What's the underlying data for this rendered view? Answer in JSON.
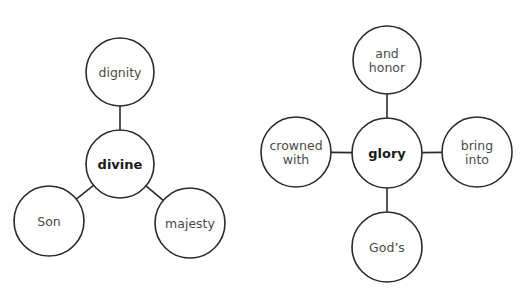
{
  "diagrams": [
    {
      "id": "divine-web",
      "center": {
        "id": "divine",
        "lines": [
          "divine"
        ]
      },
      "satellites": [
        {
          "id": "dignity",
          "lines": [
            "dignity"
          ],
          "position": "top"
        },
        {
          "id": "son",
          "lines": [
            "Son"
          ],
          "position": "bottom-left"
        },
        {
          "id": "majesty",
          "lines": [
            "majesty"
          ],
          "position": "bottom-right"
        }
      ]
    },
    {
      "id": "glory-web",
      "center": {
        "id": "glory",
        "lines": [
          "glory"
        ]
      },
      "satellites": [
        {
          "id": "and-honor",
          "lines": [
            "and",
            "honor"
          ],
          "position": "top"
        },
        {
          "id": "crowned-with",
          "lines": [
            "crowned",
            "with"
          ],
          "position": "left"
        },
        {
          "id": "bring-into",
          "lines": [
            "bring",
            "into"
          ],
          "position": "right"
        },
        {
          "id": "gods",
          "lines": [
            "God’s"
          ],
          "position": "bottom"
        }
      ]
    }
  ],
  "colors": {
    "stroke": "#2b2b2b",
    "label": "#4a4a4a",
    "center_label": "#1a1a1a",
    "background": "#ffffff"
  }
}
